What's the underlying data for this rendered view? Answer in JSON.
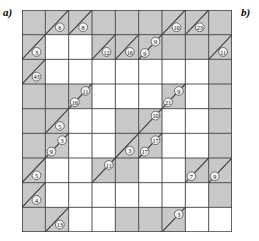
{
  "figure": {
    "label_a": "a)",
    "label_b": "b)",
    "type": "kakuro-grid"
  },
  "grid": {
    "rows": 9,
    "cols": 9,
    "cell_px": 23.3,
    "colors": {
      "clue_fill": "#c8c8c8",
      "empty_fill": "#ffffff",
      "line": "#404040",
      "border": "#404040",
      "circle_fill": "#f2f2f2",
      "text": "#111111"
    },
    "clues": [
      {
        "name": "clue-r1c2-down",
        "row": 1,
        "col": 2,
        "value": "6",
        "pos": "lower-right"
      },
      {
        "name": "clue-r1c3-down",
        "row": 1,
        "col": 3,
        "value": "8",
        "pos": "lower-right"
      },
      {
        "name": "clue-r1c7-down",
        "row": 1,
        "col": 7,
        "value": "10",
        "pos": "lower-right"
      },
      {
        "name": "clue-r1c8-down",
        "row": 1,
        "col": 8,
        "value": "23",
        "pos": "lower-right"
      },
      {
        "name": "clue-r2c1-across",
        "row": 2,
        "col": 1,
        "value": "3",
        "pos": "lower-right"
      },
      {
        "name": "clue-r2c4-across",
        "row": 2,
        "col": 4,
        "value": "12",
        "pos": "lower-right"
      },
      {
        "name": "clue-r2c5-across",
        "row": 2,
        "col": 5,
        "value": "16",
        "pos": "lower-right"
      },
      {
        "name": "clue-r2c6-across",
        "row": 2,
        "col": 6,
        "value": "9",
        "pos": "lower-left"
      },
      {
        "name": "clue-r2c6-down",
        "row": 2,
        "col": 6,
        "value": "9",
        "pos": "upper-right"
      },
      {
        "name": "clue-r2c9-across",
        "row": 2,
        "col": 9,
        "value": "11",
        "pos": "lower-right"
      },
      {
        "name": "clue-r3c1-across",
        "row": 3,
        "col": 1,
        "value": "43",
        "pos": "lower-right"
      },
      {
        "name": "clue-r4c3-down",
        "row": 4,
        "col": 3,
        "value": "11",
        "pos": "upper-right"
      },
      {
        "name": "clue-r4c3-across",
        "row": 4,
        "col": 3,
        "value": "16",
        "pos": "lower-left"
      },
      {
        "name": "clue-r4c7-down",
        "row": 4,
        "col": 7,
        "value": "9",
        "pos": "upper-right"
      },
      {
        "name": "clue-r4c7-across",
        "row": 4,
        "col": 7,
        "value": "21",
        "pos": "lower-left"
      },
      {
        "name": "clue-r5c2-down",
        "row": 5,
        "col": 2,
        "value": "5",
        "pos": "lower-right"
      },
      {
        "name": "clue-r5c6-down",
        "row": 5,
        "col": 6,
        "value": "10",
        "pos": "upper-right"
      },
      {
        "name": "clue-r6c2-down",
        "row": 6,
        "col": 2,
        "value": "3",
        "pos": "upper-right"
      },
      {
        "name": "clue-r6c2-across",
        "row": 6,
        "col": 2,
        "value": "9",
        "pos": "lower-left"
      },
      {
        "name": "clue-r6c5-across",
        "row": 6,
        "col": 5,
        "value": "3",
        "pos": "lower-right"
      },
      {
        "name": "clue-r6c6-down",
        "row": 6,
        "col": 6,
        "value": "17",
        "pos": "upper-right"
      },
      {
        "name": "clue-r6c6-across",
        "row": 6,
        "col": 6,
        "value": "17",
        "pos": "lower-left"
      },
      {
        "name": "clue-r7c1-across",
        "row": 7,
        "col": 1,
        "value": "5",
        "pos": "lower-right"
      },
      {
        "name": "clue-r7c4-down",
        "row": 7,
        "col": 4,
        "value": "11",
        "pos": "upper-right"
      },
      {
        "name": "clue-r7c8-across",
        "row": 7,
        "col": 8,
        "value": "7",
        "pos": "lower-left"
      },
      {
        "name": "clue-r7c9-across",
        "row": 7,
        "col": 9,
        "value": "9",
        "pos": "lower-left"
      },
      {
        "name": "clue-r8c1-across",
        "row": 8,
        "col": 1,
        "value": "4",
        "pos": "lower-right"
      },
      {
        "name": "clue-r9c2-down",
        "row": 9,
        "col": 2,
        "value": "13",
        "pos": "lower-right"
      },
      {
        "name": "clue-r9c7-down",
        "row": 9,
        "col": 7,
        "value": "3",
        "pos": "upper-right"
      }
    ],
    "shaded_cells": [
      {
        "row": 1,
        "col": 1
      },
      {
        "row": 1,
        "col": 4
      },
      {
        "row": 1,
        "col": 5
      },
      {
        "row": 1,
        "col": 6
      },
      {
        "row": 1,
        "col": 9
      },
      {
        "row": 2,
        "col": 7
      },
      {
        "row": 2,
        "col": 8
      },
      {
        "row": 3,
        "col": 9
      },
      {
        "row": 4,
        "col": 1
      },
      {
        "row": 4,
        "col": 2
      },
      {
        "row": 4,
        "col": 9
      },
      {
        "row": 5,
        "col": 1
      },
      {
        "row": 5,
        "col": 5
      },
      {
        "row": 5,
        "col": 9
      },
      {
        "row": 6,
        "col": 1
      },
      {
        "row": 6,
        "col": 9
      },
      {
        "row": 7,
        "col": 5
      },
      {
        "row": 8,
        "col": 9
      },
      {
        "row": 9,
        "col": 1
      },
      {
        "row": 9,
        "col": 5
      },
      {
        "row": 9,
        "col": 6
      }
    ]
  }
}
